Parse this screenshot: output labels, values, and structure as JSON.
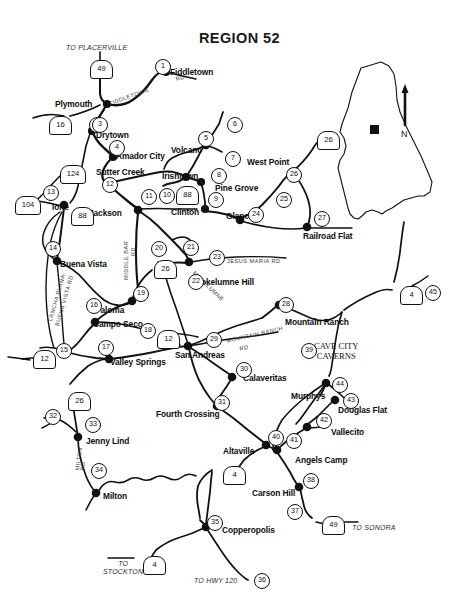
{
  "title": "REGION 52",
  "places": [
    {
      "name": "Fiddletown",
      "x": 170,
      "y": 68,
      "align": "left"
    },
    {
      "name": "Plymouth",
      "x": 55,
      "y": 100,
      "align": "left"
    },
    {
      "name": "Drytown",
      "x": 96,
      "y": 131,
      "align": "left"
    },
    {
      "name": "Amador City",
      "x": 116,
      "y": 152,
      "align": "left"
    },
    {
      "name": "Volcano",
      "x": 171,
      "y": 146,
      "align": "left"
    },
    {
      "name": "West Point",
      "x": 247,
      "y": 158,
      "align": "left"
    },
    {
      "name": "Sutter Creek",
      "x": 96,
      "y": 168,
      "align": "left"
    },
    {
      "name": "Irishtown",
      "x": 162,
      "y": 172,
      "align": "left"
    },
    {
      "name": "Pine Grove",
      "x": 215,
      "y": 184,
      "align": "left"
    },
    {
      "name": "Ione",
      "x": 52,
      "y": 203,
      "align": "left"
    },
    {
      "name": "Jackson",
      "x": 89,
      "y": 209,
      "align": "left"
    },
    {
      "name": "Clinton",
      "x": 171,
      "y": 208,
      "align": "left"
    },
    {
      "name": "Glencoe",
      "x": 226,
      "y": 212,
      "align": "left"
    },
    {
      "name": "Railroad Flat",
      "x": 303,
      "y": 232,
      "align": "left"
    },
    {
      "name": "Buena Vista",
      "x": 60,
      "y": 260,
      "align": "left"
    },
    {
      "name": "Mokelumne Hill",
      "x": 194,
      "y": 278,
      "align": "left"
    },
    {
      "name": "Paloma",
      "x": 95,
      "y": 306,
      "align": "left"
    },
    {
      "name": "Mountain Ranch",
      "x": 285,
      "y": 318,
      "align": "left"
    },
    {
      "name": "Campo Seco",
      "x": 93,
      "y": 320,
      "align": "left"
    },
    {
      "name": "San Andreas",
      "x": 175,
      "y": 351,
      "align": "left"
    },
    {
      "name": "Valley Springs",
      "x": 110,
      "y": 358,
      "align": "left"
    },
    {
      "name": "Calaveritas",
      "x": 243,
      "y": 374,
      "align": "left"
    },
    {
      "name": "Murphys",
      "x": 291,
      "y": 392,
      "align": "left"
    },
    {
      "name": "Douglas Flat",
      "x": 338,
      "y": 406,
      "align": "left"
    },
    {
      "name": "Fourth Crossing",
      "x": 156,
      "y": 410,
      "align": "left"
    },
    {
      "name": "Vallecito",
      "x": 331,
      "y": 428,
      "align": "left"
    },
    {
      "name": "Altaville",
      "x": 223,
      "y": 447,
      "align": "left"
    },
    {
      "name": "Jenny Lind",
      "x": 86,
      "y": 437,
      "align": "left"
    },
    {
      "name": "Angels Camp",
      "x": 295,
      "y": 456,
      "align": "left"
    },
    {
      "name": "Carson Hill",
      "x": 252,
      "y": 489,
      "align": "left"
    },
    {
      "name": "Milton",
      "x": 103,
      "y": 492,
      "align": "left"
    },
    {
      "name": "Copperopolis",
      "x": 222,
      "y": 526,
      "align": "left"
    }
  ],
  "multiline_places": [
    {
      "lines": [
        "Sutter",
        "Creek"
      ],
      "x": 0,
      "y": 0,
      "hidden": true
    }
  ],
  "poi": [
    {
      "lines": [
        "CAVE CITY",
        "CAVERNS"
      ],
      "x": 314,
      "y": 341
    }
  ],
  "notes": [
    {
      "text": "TO PLACERVILLE",
      "x": 66,
      "y": 44
    },
    {
      "text": "TO SONORA",
      "x": 352,
      "y": 524
    },
    {
      "text": "TO HWY 120",
      "x": 194,
      "y": 577
    },
    {
      "lines": [
        "TO",
        "STOCKTON"
      ],
      "x": 103,
      "y": 560
    }
  ],
  "road_labels": [
    {
      "text": "FIDDLETOWN",
      "x": 108,
      "y": 101,
      "rot": -20
    },
    {
      "text": "RD",
      "x": 175,
      "y": 76,
      "rot": -15
    },
    {
      "text": "JESUS   MARIA   RD",
      "x": 227,
      "y": 258,
      "rot": 0
    },
    {
      "text": "MOKELUMNE",
      "x": 196,
      "y": 270,
      "rot": 44
    },
    {
      "text": "MIDDLE  BAR",
      "x": 123,
      "y": 280,
      "rot": -90
    },
    {
      "text": "RD",
      "x": 130,
      "y": 256,
      "rot": -90
    },
    {
      "text": "LANCHA PLANA-",
      "x": 47,
      "y": 320,
      "rot": -74
    },
    {
      "text": "BUENA VISTA  RD",
      "x": 54,
      "y": 325,
      "rot": -74
    },
    {
      "text": "MOUNTAIN RANCH",
      "x": 226,
      "y": 338,
      "rot": -13
    },
    {
      "text": "RD",
      "x": 239,
      "y": 346,
      "rot": -13
    },
    {
      "text": "MILTON",
      "x": 74,
      "y": 470,
      "rot": -82
    },
    {
      "text": "RD",
      "x": 79,
      "y": 470,
      "rot": -82
    }
  ],
  "site_numbers": [
    {
      "n": "1",
      "x": 155,
      "y": 59
    },
    {
      "n": "2",
      "x": 89,
      "y": 117
    },
    {
      "n": "3",
      "x": 92,
      "y": 117
    },
    {
      "n": "4",
      "x": 109,
      "y": 140
    },
    {
      "n": "5",
      "x": 198,
      "y": 131
    },
    {
      "n": "6",
      "x": 227,
      "y": 117
    },
    {
      "n": "7",
      "x": 225,
      "y": 151
    },
    {
      "n": "8",
      "x": 211,
      "y": 168
    },
    {
      "n": "9",
      "x": 208,
      "y": 192
    },
    {
      "n": "10",
      "x": 159,
      "y": 188
    },
    {
      "n": "11",
      "x": 141,
      "y": 189
    },
    {
      "n": "12",
      "x": 102,
      "y": 177
    },
    {
      "n": "13",
      "x": 43,
      "y": 185
    },
    {
      "n": "14",
      "x": 45,
      "y": 241
    },
    {
      "n": "15",
      "x": 56,
      "y": 343
    },
    {
      "n": "16",
      "x": 86,
      "y": 298
    },
    {
      "n": "17",
      "x": 98,
      "y": 340
    },
    {
      "n": "18",
      "x": 140,
      "y": 323
    },
    {
      "n": "19",
      "x": 133,
      "y": 286
    },
    {
      "n": "20",
      "x": 151,
      "y": 241
    },
    {
      "n": "21",
      "x": 183,
      "y": 240
    },
    {
      "n": "22",
      "x": 188,
      "y": 274
    },
    {
      "n": "23",
      "x": 209,
      "y": 250
    },
    {
      "n": "24",
      "x": 248,
      "y": 207
    },
    {
      "n": "25",
      "x": 276,
      "y": 192
    },
    {
      "n": "26",
      "x": 286,
      "y": 167
    },
    {
      "n": "27",
      "x": 314,
      "y": 211
    },
    {
      "n": "28",
      "x": 278,
      "y": 297
    },
    {
      "n": "29",
      "x": 206,
      "y": 332
    },
    {
      "n": "30",
      "x": 236,
      "y": 362
    },
    {
      "n": "31",
      "x": 214,
      "y": 395
    },
    {
      "n": "32",
      "x": 45,
      "y": 409
    },
    {
      "n": "33",
      "x": 85,
      "y": 417
    },
    {
      "n": "34",
      "x": 91,
      "y": 463
    },
    {
      "n": "35",
      "x": 207,
      "y": 515
    },
    {
      "n": "36",
      "x": 254,
      "y": 573
    },
    {
      "n": "37",
      "x": 287,
      "y": 504
    },
    {
      "n": "38",
      "x": 303,
      "y": 473
    },
    {
      "n": "39",
      "x": 301,
      "y": 343
    },
    {
      "n": "40",
      "x": 268,
      "y": 430
    },
    {
      "n": "41",
      "x": 286,
      "y": 433
    },
    {
      "n": "42",
      "x": 316,
      "y": 413
    },
    {
      "n": "43",
      "x": 343,
      "y": 393
    },
    {
      "n": "44",
      "x": 332,
      "y": 377
    },
    {
      "n": "45",
      "x": 425,
      "y": 285
    }
  ],
  "shields": [
    {
      "n": "49",
      "x": 90,
      "y": 60
    },
    {
      "n": "16",
      "x": 49,
      "y": 116
    },
    {
      "n": "124",
      "x": 60,
      "y": 165
    },
    {
      "n": "104",
      "x": 15,
      "y": 196
    },
    {
      "n": "88",
      "x": 71,
      "y": 207
    },
    {
      "n": "88",
      "x": 176,
      "y": 186
    },
    {
      "n": "26",
      "x": 317,
      "y": 131
    },
    {
      "n": "26",
      "x": 154,
      "y": 260
    },
    {
      "n": "12",
      "x": 157,
      "y": 330
    },
    {
      "n": "12",
      "x": 33,
      "y": 350
    },
    {
      "n": "26",
      "x": 68,
      "y": 392
    },
    {
      "n": "4",
      "x": 400,
      "y": 286
    },
    {
      "n": "4",
      "x": 223,
      "y": 466
    },
    {
      "n": "4",
      "x": 143,
      "y": 556
    },
    {
      "n": "49",
      "x": 322,
      "y": 516
    }
  ],
  "inset": {
    "north_label": "N"
  }
}
